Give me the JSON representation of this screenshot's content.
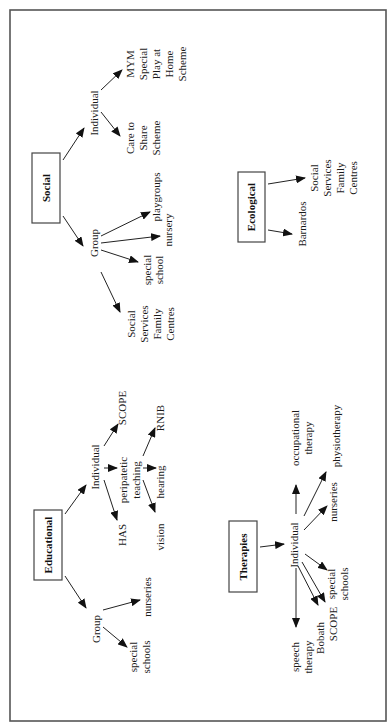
{
  "diagram": {
    "orientation": "rotated-90-ccw",
    "frame_color": "#555555",
    "social": {
      "title": "Social",
      "individual": {
        "label": "Individual",
        "children": [
          [
            "MYM",
            "Special",
            "Play at",
            "Home",
            "Scheme"
          ],
          [
            "Care to",
            "Share",
            "Scheme"
          ]
        ]
      },
      "group": {
        "label": "Group",
        "children": [
          [
            "playgroups"
          ],
          [
            "nursery"
          ],
          [
            "special",
            "school"
          ],
          [
            "Social",
            "Services",
            "Family",
            "Centres"
          ]
        ]
      }
    },
    "ecological": {
      "title": "Ecological",
      "children": [
        [
          "Social",
          "Services",
          "Family",
          "Centres"
        ],
        [
          "Barnardos"
        ]
      ]
    },
    "educational": {
      "title": "Educational",
      "individual": {
        "label": "Individual",
        "children": {
          "scope": "SCOPE",
          "has": "HAS",
          "peripatetic": [
            "peripatetic",
            "teaching"
          ],
          "peripatetic_children": {
            "rnib": "RNIB",
            "hearing": "hearing",
            "vision": "vision"
          }
        }
      },
      "group": {
        "label": "Group",
        "children": [
          [
            "nurseries"
          ],
          [
            "special",
            "schools"
          ]
        ]
      }
    },
    "therapies": {
      "title": "Therapies",
      "individual": {
        "label": "Individual",
        "children": {
          "occupational": [
            "occupational",
            "therapy"
          ],
          "physiotherapy": "physiotherapy",
          "nurseries": "nurseries",
          "special_schools": [
            "special",
            "schools"
          ],
          "scope": "SCOPE",
          "bobath": "Bobath",
          "speech": [
            "speech",
            "therapy"
          ]
        }
      }
    }
  }
}
